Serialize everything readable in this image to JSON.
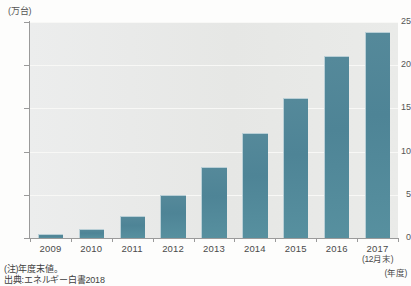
{
  "chart_data": {
    "type": "bar",
    "title": "",
    "subtitle": "",
    "xlabel": "(年度)",
    "ylabel": "(万台)",
    "categories": [
      "2009",
      "2010",
      "2011",
      "2012",
      "2013",
      "2014",
      "2015",
      "2016",
      "2017"
    ],
    "category_sublabels": [
      "",
      "",
      "",
      "",
      "",
      "",
      "",
      "",
      "(12月末)"
    ],
    "values": [
      0.5,
      1.1,
      2.6,
      5.0,
      8.2,
      12.2,
      16.2,
      21.1,
      23.8
    ],
    "ylim": [
      0,
      25
    ],
    "yticks": [
      0,
      5,
      10,
      15,
      20,
      25
    ],
    "ytick_labels": [
      "0",
      "5",
      "10",
      "15",
      "20",
      "25"
    ],
    "grid": true,
    "grid_axis": "y",
    "legend": false,
    "series_color": "#4e8496",
    "plot_background": "#e9eae8"
  },
  "annotations": {
    "note": "(注)年度末値。",
    "source": "出典:エネルギー白書2018"
  },
  "colors": {
    "bar": "#4e8496",
    "bar_highlight": "#b9cfd6",
    "plot_bg": "#e9eae8",
    "gridline": "#f8f8f6",
    "axis": "#9a9a9a",
    "text": "#4a4a4a"
  }
}
